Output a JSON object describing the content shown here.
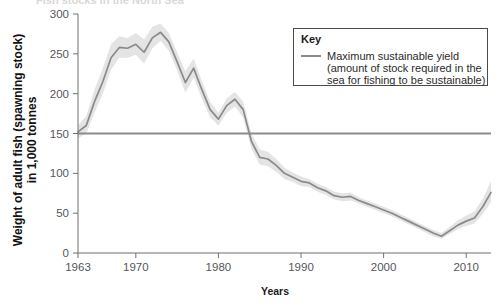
{
  "figure": {
    "cut_off_title": "Fish stocks in the North Sea",
    "background_color": "#ffffff"
  },
  "legend": {
    "title": "Key",
    "entries": [
      {
        "swatch_color": "#8b8b8b",
        "lines": [
          "Maximum sustainable yield",
          "(amount of stock required in the",
          "sea for fishing to be sustainable)"
        ]
      }
    ],
    "border_color": "#444444"
  },
  "chart_data": {
    "type": "line",
    "title": "",
    "subtitle": "",
    "xlabel": "Years",
    "ylabel": "Weight of adult fish (spawning stock) in 1,000 tonnes",
    "xlim": [
      1963,
      2013
    ],
    "ylim": [
      0,
      300
    ],
    "grid": false,
    "legend_position": "top-right",
    "x_tick_labels": [
      "1963",
      "1970",
      "1980",
      "1990",
      "2000",
      "2010"
    ],
    "x_ticks": [
      1963,
      1970,
      1980,
      1990,
      2000,
      2010
    ],
    "y_tick_labels": [
      "0",
      "50",
      "100",
      "150",
      "200",
      "250",
      "300"
    ],
    "y_ticks": [
      0,
      50,
      100,
      150,
      200,
      250,
      300
    ],
    "line_color": "#8a8a8a",
    "band_color": "#e4e4e4",
    "reference_line_color": "#8b8b8b",
    "annotations": [
      {
        "name": "maximum-sustainable-yield-line",
        "type": "hline",
        "value": 150,
        "label": "Maximum sustainable yield"
      }
    ],
    "series": [
      {
        "name": "Spawning stock biomass",
        "x": [
          1963,
          1964,
          1965,
          1966,
          1967,
          1968,
          1969,
          1970,
          1971,
          1972,
          1973,
          1974,
          1975,
          1976,
          1977,
          1978,
          1979,
          1980,
          1981,
          1982,
          1983,
          1984,
          1985,
          1986,
          1987,
          1988,
          1989,
          1990,
          1991,
          1992,
          1993,
          1994,
          1995,
          1996,
          1997,
          1998,
          1999,
          2000,
          2001,
          2002,
          2003,
          2004,
          2005,
          2006,
          2007,
          2008,
          2009,
          2010,
          2011,
          2012,
          2013
        ],
        "values": [
          152,
          160,
          190,
          215,
          245,
          258,
          257,
          262,
          252,
          270,
          277,
          265,
          240,
          214,
          232,
          205,
          180,
          168,
          185,
          193,
          180,
          140,
          120,
          118,
          110,
          100,
          95,
          90,
          88,
          82,
          78,
          72,
          70,
          71,
          66,
          62,
          58,
          54,
          50,
          45,
          40,
          35,
          30,
          25,
          21,
          28,
          35,
          40,
          44,
          58,
          76
        ],
        "band_upper": [
          160,
          172,
          205,
          232,
          262,
          272,
          270,
          276,
          268,
          284,
          288,
          276,
          252,
          228,
          244,
          216,
          190,
          176,
          194,
          202,
          190,
          150,
          130,
          127,
          118,
          107,
          101,
          96,
          93,
          87,
          83,
          77,
          75,
          76,
          70,
          66,
          62,
          58,
          54,
          49,
          44,
          39,
          34,
          29,
          25,
          33,
          41,
          47,
          52,
          68,
          90
        ],
        "band_lower": [
          144,
          150,
          176,
          200,
          230,
          245,
          245,
          249,
          238,
          257,
          266,
          254,
          229,
          201,
          220,
          194,
          170,
          160,
          176,
          184,
          170,
          131,
          111,
          109,
          102,
          93,
          89,
          84,
          83,
          77,
          73,
          67,
          65,
          66,
          62,
          58,
          54,
          50,
          46,
          41,
          36,
          31,
          26,
          21,
          18,
          24,
          30,
          34,
          37,
          49,
          64
        ]
      }
    ]
  }
}
